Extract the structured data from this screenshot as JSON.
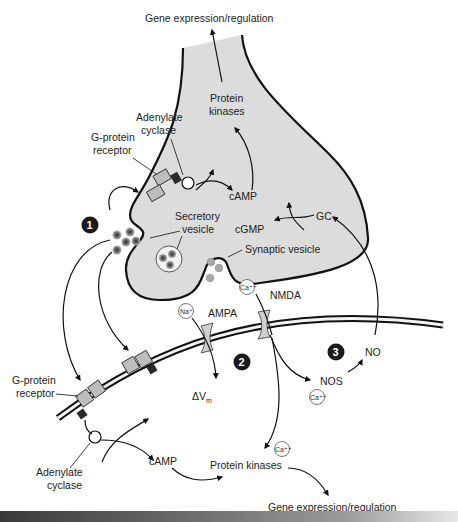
{
  "diagram": {
    "labels": {
      "gene_top": "Gene expression/regulation",
      "protein_kinases_top_1": "Protein",
      "protein_kinases_top_2": "kinases",
      "adenylate_top_1": "Adenylate",
      "adenylate_top_2": "cyclase",
      "gprotein_top_1": "G-protein",
      "gprotein_top_2": "receptor",
      "camp_top": "cAMP",
      "secretory_1": "Secretory",
      "secretory_2": "vesicle",
      "cgmp": "cGMP",
      "gc": "GC",
      "synaptic_vesicle": "Synaptic vesicle",
      "ampa": "AMPA",
      "nmda": "NMDA",
      "delta_v": "ΔV",
      "delta_v_sub": "m",
      "nos": "NOS",
      "no": "NO",
      "gprotein_bottom_1": "G-protein",
      "gprotein_bottom_2": "receptor",
      "adenylate_bottom_1": "Adenylate",
      "adenylate_bottom_2": "cyclase",
      "camp_bottom": "cAMP",
      "protein_kinases_bottom": "Protein kinases",
      "gene_bottom": "Gene expression/regulation"
    },
    "ions": {
      "na": "Na⁺",
      "ca_nmda": "Ca⁺⁺",
      "ca_nos": "Ca⁺⁺",
      "ca_pk": "Ca⁺⁺"
    },
    "markers": [
      "1",
      "2",
      "3"
    ],
    "colors": {
      "terminal_fill": "#dcdcdc",
      "line": "#111111",
      "receptor_fill": "#bdbdbd",
      "receptor_dark": "#2a2a2a",
      "marker_fill": "#1a1a1a",
      "vesicle_fill": "#a8a8a8"
    }
  }
}
